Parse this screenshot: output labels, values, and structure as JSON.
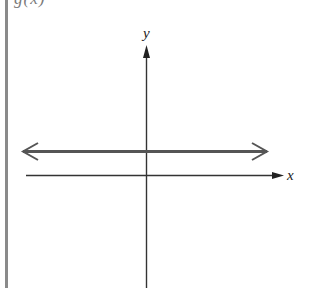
{
  "figure": {
    "top_label": "g(x)",
    "x_axis_label": "x",
    "y_axis_label": "y",
    "colors": {
      "axis": "#222222",
      "horizontal_line": "#555555",
      "border": "#8a8a8a"
    }
  },
  "graph": {
    "description": "Horizontal line above the x-axis with arrows at both ends (constant function)",
    "line_type": "horizontal",
    "line_position": "above x-axis",
    "arrows": [
      "left",
      "right"
    ]
  }
}
